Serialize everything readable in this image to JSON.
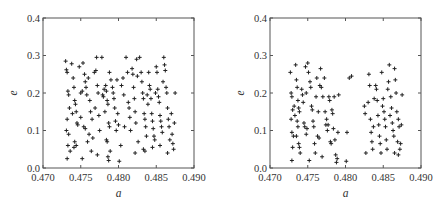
{
  "chart_data": [
    {
      "type": "scatter",
      "title": "",
      "xlabel": "a",
      "ylabel": "e",
      "xlim": [
        0.47,
        0.49
      ],
      "ylim": [
        0.0,
        0.4
      ],
      "xticks": [
        "0.470",
        "0.475",
        "0.480",
        "0.485",
        "0.490"
      ],
      "yticks": [
        "0.0",
        "0.1",
        "0.2",
        "0.3",
        "0.4"
      ],
      "grid": false,
      "marker": "+",
      "marker_color": "#222222",
      "frame": {
        "left": 43,
        "top": 18,
        "right": 194,
        "bottom": 168
      },
      "points": [
        [
          0.473,
          0.285
        ],
        [
          0.4731,
          0.262
        ],
        [
          0.4732,
          0.255
        ],
        [
          0.4733,
          0.205
        ],
        [
          0.4734,
          0.195
        ],
        [
          0.4735,
          0.16
        ],
        [
          0.4732,
          0.13
        ],
        [
          0.4731,
          0.1
        ],
        [
          0.4734,
          0.09
        ],
        [
          0.4733,
          0.06
        ],
        [
          0.4732,
          0.025
        ],
        [
          0.4736,
          0.045
        ],
        [
          0.4738,
          0.278
        ],
        [
          0.474,
          0.24
        ],
        [
          0.4741,
          0.215
        ],
        [
          0.4742,
          0.18
        ],
        [
          0.4743,
          0.17
        ],
        [
          0.4744,
          0.15
        ],
        [
          0.4739,
          0.145
        ],
        [
          0.4745,
          0.12
        ],
        [
          0.4746,
          0.115
        ],
        [
          0.4742,
          0.07
        ],
        [
          0.4744,
          0.06
        ],
        [
          0.4741,
          0.055
        ],
        [
          0.4748,
          0.27
        ],
        [
          0.475,
          0.2
        ],
        [
          0.4752,
          0.205
        ],
        [
          0.4753,
          0.28
        ],
        [
          0.4755,
          0.25
        ],
        [
          0.4756,
          0.23
        ],
        [
          0.4757,
          0.215
        ],
        [
          0.4758,
          0.195
        ],
        [
          0.4754,
          0.11
        ],
        [
          0.4756,
          0.105
        ],
        [
          0.4752,
          0.025
        ],
        [
          0.4759,
          0.07
        ],
        [
          0.475,
          0.135
        ],
        [
          0.476,
          0.24
        ],
        [
          0.4762,
          0.18
        ],
        [
          0.4763,
          0.15
        ],
        [
          0.4765,
          0.13
        ],
        [
          0.4761,
          0.09
        ],
        [
          0.4764,
          0.045
        ],
        [
          0.4766,
          0.08
        ],
        [
          0.4768,
          0.255
        ],
        [
          0.477,
          0.26
        ],
        [
          0.4771,
          0.295
        ],
        [
          0.4772,
          0.22
        ],
        [
          0.4773,
          0.2
        ],
        [
          0.4769,
          0.16
        ],
        [
          0.4774,
          0.14
        ],
        [
          0.4772,
          0.035
        ],
        [
          0.4775,
          0.1
        ],
        [
          0.4778,
          0.295
        ],
        [
          0.4779,
          0.195
        ],
        [
          0.478,
          0.19
        ],
        [
          0.4781,
          0.21
        ],
        [
          0.4783,
          0.22
        ],
        [
          0.4784,
          0.205
        ],
        [
          0.4785,
          0.18
        ],
        [
          0.4786,
          0.17
        ],
        [
          0.4782,
          0.15
        ],
        [
          0.4787,
          0.12
        ],
        [
          0.4788,
          0.11
        ],
        [
          0.4784,
          0.075
        ],
        [
          0.4785,
          0.07
        ],
        [
          0.4786,
          0.03
        ],
        [
          0.4787,
          0.02
        ],
        [
          0.4789,
          0.045
        ],
        [
          0.4788,
          0.255
        ],
        [
          0.479,
          0.235
        ],
        [
          0.4792,
          0.215
        ],
        [
          0.4793,
          0.2
        ],
        [
          0.4794,
          0.185
        ],
        [
          0.4795,
          0.16
        ],
        [
          0.4796,
          0.125
        ],
        [
          0.4797,
          0.1
        ],
        [
          0.4798,
          0.235
        ],
        [
          0.4799,
          0.145
        ],
        [
          0.48,
          0.115
        ],
        [
          0.4801,
          0.018
        ],
        [
          0.4803,
          0.06
        ],
        [
          0.4804,
          0.22
        ],
        [
          0.4806,
          0.24
        ],
        [
          0.4807,
          0.195
        ],
        [
          0.4808,
          0.11
        ],
        [
          0.481,
          0.295
        ],
        [
          0.4812,
          0.255
        ],
        [
          0.4813,
          0.175
        ],
        [
          0.4814,
          0.16
        ],
        [
          0.4815,
          0.135
        ],
        [
          0.4816,
          0.1
        ],
        [
          0.4818,
          0.265
        ],
        [
          0.4819,
          0.25
        ],
        [
          0.482,
          0.215
        ],
        [
          0.4821,
          0.185
        ],
        [
          0.4822,
          0.15
        ],
        [
          0.4823,
          0.12
        ],
        [
          0.4824,
          0.29
        ],
        [
          0.4825,
          0.245
        ],
        [
          0.4826,
          0.07
        ],
        [
          0.4822,
          0.04
        ],
        [
          0.4828,
          0.295
        ],
        [
          0.483,
          0.255
        ],
        [
          0.4831,
          0.23
        ],
        [
          0.4832,
          0.2
        ],
        [
          0.4833,
          0.185
        ],
        [
          0.4834,
          0.145
        ],
        [
          0.4835,
          0.13
        ],
        [
          0.4836,
          0.11
        ],
        [
          0.4837,
          0.085
        ],
        [
          0.4833,
          0.05
        ],
        [
          0.4835,
          0.045
        ],
        [
          0.4838,
          0.195
        ],
        [
          0.4839,
          0.17
        ],
        [
          0.484,
          0.255
        ],
        [
          0.4841,
          0.22
        ],
        [
          0.4842,
          0.21
        ],
        [
          0.4843,
          0.185
        ],
        [
          0.4844,
          0.145
        ],
        [
          0.4845,
          0.125
        ],
        [
          0.4846,
          0.105
        ],
        [
          0.4847,
          0.085
        ],
        [
          0.4848,
          0.075
        ],
        [
          0.4845,
          0.055
        ],
        [
          0.4849,
          0.2
        ],
        [
          0.485,
          0.27
        ],
        [
          0.4851,
          0.255
        ],
        [
          0.4852,
          0.21
        ],
        [
          0.4853,
          0.19
        ],
        [
          0.4854,
          0.175
        ],
        [
          0.4855,
          0.14
        ],
        [
          0.4856,
          0.125
        ],
        [
          0.4857,
          0.11
        ],
        [
          0.4858,
          0.095
        ],
        [
          0.4855,
          0.06
        ],
        [
          0.4859,
          0.23
        ],
        [
          0.486,
          0.295
        ],
        [
          0.4861,
          0.275
        ],
        [
          0.4862,
          0.26
        ],
        [
          0.4863,
          0.215
        ],
        [
          0.4864,
          0.2
        ],
        [
          0.4865,
          0.16
        ],
        [
          0.4866,
          0.13
        ],
        [
          0.4867,
          0.11
        ],
        [
          0.4868,
          0.075
        ],
        [
          0.4865,
          0.04
        ],
        [
          0.487,
          0.145
        ],
        [
          0.4871,
          0.09
        ],
        [
          0.4872,
          0.065
        ],
        [
          0.4873,
          0.05
        ],
        [
          0.4874,
          0.12
        ],
        [
          0.4875,
          0.2
        ]
      ]
    },
    {
      "type": "scatter",
      "title": "",
      "xlabel": "a",
      "ylabel": "e",
      "xlim": [
        0.47,
        0.49
      ],
      "ylim": [
        0.0,
        0.4
      ],
      "xticks": [
        "0.470",
        "0.475",
        "0.480",
        "0.485",
        "0.490"
      ],
      "yticks": [
        "0.0",
        "0.1",
        "0.2",
        "0.3",
        "0.4"
      ],
      "grid": false,
      "marker": "+",
      "marker_color": "#222222",
      "frame": {
        "left": 270,
        "top": 18,
        "right": 421,
        "bottom": 168
      },
      "points": [
        [
          0.4727,
          0.255
        ],
        [
          0.4728,
          0.2
        ],
        [
          0.4729,
          0.19
        ],
        [
          0.473,
          0.155
        ],
        [
          0.4728,
          0.13
        ],
        [
          0.4729,
          0.095
        ],
        [
          0.4731,
          0.085
        ],
        [
          0.473,
          0.055
        ],
        [
          0.4729,
          0.02
        ],
        [
          0.4732,
          0.165
        ],
        [
          0.4733,
          0.14
        ],
        [
          0.4734,
          0.275
        ],
        [
          0.4735,
          0.235
        ],
        [
          0.4736,
          0.215
        ],
        [
          0.4737,
          0.18
        ],
        [
          0.4738,
          0.16
        ],
        [
          0.4739,
          0.15
        ],
        [
          0.4736,
          0.125
        ],
        [
          0.4737,
          0.11
        ],
        [
          0.4738,
          0.065
        ],
        [
          0.4739,
          0.055
        ],
        [
          0.474,
          0.04
        ],
        [
          0.4735,
          0.085
        ],
        [
          0.4742,
          0.21
        ],
        [
          0.4743,
          0.195
        ],
        [
          0.4744,
          0.175
        ],
        [
          0.4745,
          0.12
        ],
        [
          0.4746,
          0.11
        ],
        [
          0.4747,
          0.27
        ],
        [
          0.4748,
          0.2
        ],
        [
          0.4749,
          0.105
        ],
        [
          0.475,
          0.28
        ],
        [
          0.4751,
          0.255
        ],
        [
          0.4752,
          0.02
        ],
        [
          0.4753,
          0.23
        ],
        [
          0.4754,
          0.215
        ],
        [
          0.4748,
          0.09
        ],
        [
          0.4755,
          0.165
        ],
        [
          0.4756,
          0.155
        ],
        [
          0.4757,
          0.125
        ],
        [
          0.4758,
          0.11
        ],
        [
          0.4759,
          0.065
        ],
        [
          0.476,
          0.04
        ],
        [
          0.4761,
          0.19
        ],
        [
          0.4762,
          0.24
        ],
        [
          0.4763,
          0.085
        ],
        [
          0.4764,
          0.15
        ],
        [
          0.4765,
          0.08
        ],
        [
          0.4766,
          0.22
        ],
        [
          0.4767,
          0.265
        ],
        [
          0.4768,
          0.215
        ],
        [
          0.4769,
          0.03
        ],
        [
          0.477,
          0.19
        ],
        [
          0.4772,
          0.24
        ],
        [
          0.4773,
          0.15
        ],
        [
          0.4774,
          0.115
        ],
        [
          0.4775,
          0.13
        ],
        [
          0.4776,
          0.1
        ],
        [
          0.4777,
          0.115
        ],
        [
          0.4778,
          0.19
        ],
        [
          0.4779,
          0.18
        ],
        [
          0.478,
          0.07
        ],
        [
          0.4781,
          0.065
        ],
        [
          0.4782,
          0.155
        ],
        [
          0.4783,
          0.145
        ],
        [
          0.4784,
          0.105
        ],
        [
          0.4785,
          0.19
        ],
        [
          0.4786,
          0.075
        ],
        [
          0.4787,
          0.035
        ],
        [
          0.4788,
          0.015
        ],
        [
          0.4789,
          0.025
        ],
        [
          0.479,
          0.095
        ],
        [
          0.4791,
          0.195
        ],
        [
          0.4802,
          0.095
        ],
        [
          0.4801,
          0.018
        ],
        [
          0.4805,
          0.24
        ],
        [
          0.4808,
          0.245
        ],
        [
          0.4825,
          0.165
        ],
        [
          0.4826,
          0.145
        ],
        [
          0.4827,
          0.04
        ],
        [
          0.483,
          0.175
        ],
        [
          0.4831,
          0.25
        ],
        [
          0.4832,
          0.22
        ],
        [
          0.4833,
          0.13
        ],
        [
          0.4834,
          0.095
        ],
        [
          0.4835,
          0.07
        ],
        [
          0.4836,
          0.05
        ],
        [
          0.4837,
          0.11
        ],
        [
          0.4838,
          0.185
        ],
        [
          0.484,
          0.22
        ],
        [
          0.4841,
          0.21
        ],
        [
          0.4842,
          0.18
        ],
        [
          0.4843,
          0.14
        ],
        [
          0.4844,
          0.115
        ],
        [
          0.4845,
          0.085
        ],
        [
          0.4846,
          0.065
        ],
        [
          0.4847,
          0.04
        ],
        [
          0.4848,
          0.255
        ],
        [
          0.4849,
          0.165
        ],
        [
          0.485,
          0.185
        ],
        [
          0.4851,
          0.15
        ],
        [
          0.4852,
          0.13
        ],
        [
          0.4853,
          0.11
        ],
        [
          0.4854,
          0.075
        ],
        [
          0.4855,
          0.05
        ],
        [
          0.4856,
          0.21
        ],
        [
          0.4857,
          0.23
        ],
        [
          0.4858,
          0.275
        ],
        [
          0.4859,
          0.14
        ],
        [
          0.486,
          0.19
        ],
        [
          0.4861,
          0.16
        ],
        [
          0.4862,
          0.12
        ],
        [
          0.4863,
          0.1
        ],
        [
          0.4864,
          0.085
        ],
        [
          0.4865,
          0.265
        ],
        [
          0.4866,
          0.235
        ],
        [
          0.4867,
          0.2
        ],
        [
          0.4868,
          0.15
        ],
        [
          0.4869,
          0.07
        ],
        [
          0.4865,
          0.04
        ],
        [
          0.487,
          0.13
        ],
        [
          0.4871,
          0.11
        ],
        [
          0.4872,
          0.05
        ],
        [
          0.4873,
          0.065
        ],
        [
          0.4874,
          0.115
        ],
        [
          0.4875,
          0.195
        ],
        [
          0.487,
          0.035
        ]
      ]
    }
  ]
}
